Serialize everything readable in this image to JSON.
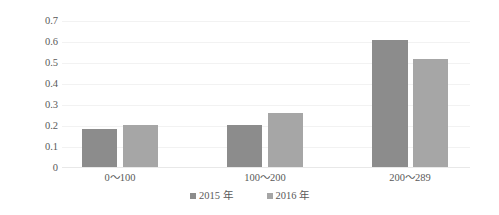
{
  "chart_data": {
    "type": "bar",
    "title": "",
    "xlabel": "",
    "ylabel": "",
    "categories": [
      "0～100",
      "100～200",
      "200～289"
    ],
    "series": [
      {
        "name": "2015 年",
        "color": "#8c8c8c",
        "values": [
          0.18,
          0.2,
          0.61
        ]
      },
      {
        "name": "2016 年",
        "color": "#a6a6a6",
        "values": [
          0.2,
          0.26,
          0.52
        ]
      }
    ],
    "ylim": [
      0,
      0.7
    ],
    "yticks": [
      "0.7",
      "0.6",
      "0.5",
      "0.4",
      "0.3",
      "0.2",
      "0.1",
      "0"
    ],
    "ytick_values": [
      0.7,
      0.6,
      0.5,
      0.4,
      0.3,
      0.2,
      0.1,
      0
    ],
    "grid": true,
    "legend_position": "bottom",
    "legend_marker": "square-icon",
    "gridline_color": "#f2f2f2",
    "background_color": "#ffffff",
    "text_color": "#595959"
  }
}
